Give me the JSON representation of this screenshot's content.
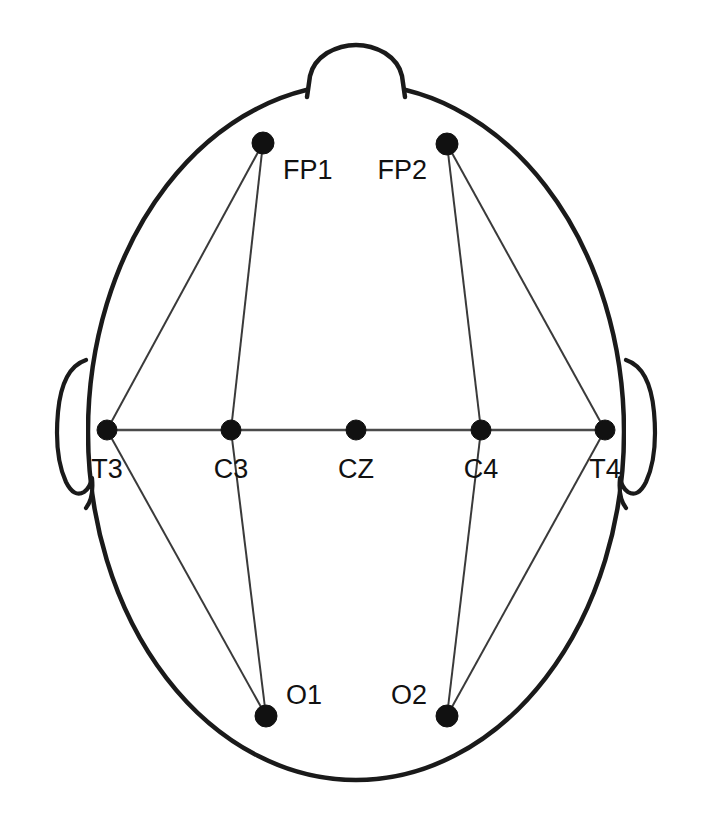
{
  "diagram": {
    "type": "eeg-electrode-placement-map",
    "view": "top-down head схема",
    "background_color": "#ffffff",
    "outline_color": "#1a1a1a",
    "electrode_color": "#111111",
    "link_color": "#3a3a3a",
    "head": {
      "cx": 356,
      "cy": 432,
      "rx": 268,
      "ry": 348
    },
    "nose": {
      "label": "nose-marker",
      "path": "M 307 97 L 310 76 Q 313 62 327 53 Q 341 45 356 45 Q 371 45 385 53 Q 399 62 402 76 L 405 97"
    },
    "ears": [
      {
        "name": "left-ear",
        "path": "M 86 360 Q 62 368 58 412 Q 54 456 66 482 Q 74 498 84 492 Q 90 488 92 478 Q 94 498 86 508"
      },
      {
        "name": "right-ear",
        "path": "M 626 360 Q 650 368 654 412 Q 658 456 646 482 Q 638 498 628 492 Q 622 488 620 478 Q 618 498 626 508"
      }
    ],
    "electrodes": [
      {
        "id": "FP1",
        "label": "FP1",
        "x": 263,
        "y": 143,
        "r": 11,
        "label_x": 283,
        "label_y": 179,
        "label_anchor": "start"
      },
      {
        "id": "FP2",
        "label": "FP2",
        "x": 447,
        "y": 144,
        "r": 11,
        "label_x": 427,
        "label_y": 179,
        "label_anchor": "end"
      },
      {
        "id": "T3",
        "label": "T3",
        "x": 107,
        "y": 430,
        "r": 10,
        "label_x": 107,
        "label_y": 478,
        "label_anchor": "middle"
      },
      {
        "id": "C3",
        "label": "C3",
        "x": 231,
        "y": 430,
        "r": 10,
        "label_x": 231,
        "label_y": 478,
        "label_anchor": "middle"
      },
      {
        "id": "CZ",
        "label": "CZ",
        "x": 356,
        "y": 430,
        "r": 10,
        "label_x": 356,
        "label_y": 478,
        "label_anchor": "middle"
      },
      {
        "id": "C4",
        "label": "C4",
        "x": 481,
        "y": 430,
        "r": 10,
        "label_x": 481,
        "label_y": 478,
        "label_anchor": "middle"
      },
      {
        "id": "T4",
        "label": "T4",
        "x": 605,
        "y": 430,
        "r": 10,
        "label_x": 605,
        "label_y": 478,
        "label_anchor": "middle"
      },
      {
        "id": "O1",
        "label": "O1",
        "x": 266,
        "y": 716,
        "r": 11,
        "label_x": 286,
        "label_y": 704,
        "label_anchor": "start"
      },
      {
        "id": "O2",
        "label": "O2",
        "x": 447,
        "y": 716,
        "r": 11,
        "label_x": 427,
        "label_y": 704,
        "label_anchor": "end"
      }
    ],
    "axis_segments": [
      {
        "name": "midline-T3-T4",
        "x1": 107,
        "y1": 430,
        "x2": 605,
        "y2": 430
      }
    ],
    "links": [
      {
        "from": "FP1",
        "to": "T3",
        "x1": 263,
        "y1": 143,
        "x2": 107,
        "y2": 430
      },
      {
        "from": "FP1",
        "to": "C3",
        "x1": 263,
        "y1": 143,
        "x2": 231,
        "y2": 430
      },
      {
        "from": "FP2",
        "to": "C4",
        "x1": 447,
        "y1": 144,
        "x2": 481,
        "y2": 430
      },
      {
        "from": "FP2",
        "to": "T4",
        "x1": 447,
        "y1": 144,
        "x2": 605,
        "y2": 430
      },
      {
        "from": "T3",
        "to": "O1",
        "x1": 107,
        "y1": 430,
        "x2": 266,
        "y2": 716
      },
      {
        "from": "C3",
        "to": "O1",
        "x1": 231,
        "y1": 430,
        "x2": 266,
        "y2": 716
      },
      {
        "from": "C4",
        "to": "O2",
        "x1": 481,
        "y1": 430,
        "x2": 447,
        "y2": 716
      },
      {
        "from": "T4",
        "to": "O2",
        "x1": 605,
        "y1": 430,
        "x2": 447,
        "y2": 716
      }
    ]
  }
}
